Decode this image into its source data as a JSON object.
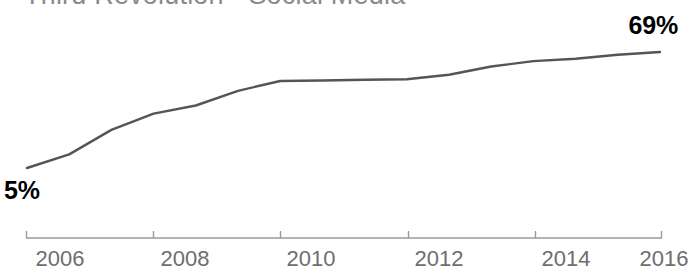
{
  "chart_data": {
    "type": "line",
    "title": "Third Revolution - Social Media",
    "xlabel": "",
    "ylabel": "",
    "x": [
      2006,
      2008,
      2010,
      2012,
      2014,
      2016
    ],
    "tick_labels": [
      "2006",
      "2008",
      "2010",
      "2012",
      "2014",
      "2016"
    ],
    "series": [
      {
        "name": "Social Media Usage",
        "values": [
          5,
          35,
          53,
          54,
          64,
          69
        ],
        "color": "#555555"
      }
    ],
    "annotations": [
      {
        "name": "start-value",
        "label": "5%",
        "value": 5,
        "x": 2006
      },
      {
        "name": "end-value",
        "label": "69%",
        "value": 69,
        "x": 2016
      }
    ],
    "xlim": [
      2006,
      2016
    ],
    "ylim": [
      0,
      75
    ],
    "grid": false,
    "legend": false,
    "axis_color": "#9a9a9a",
    "tick_label_color": "#6e6e6e",
    "title_color": "#8a8a8a",
    "value_label_color": "#000000"
  },
  "labels": {
    "start_value": "5%",
    "end_value": "69%"
  },
  "axis": {
    "ticks": [
      {
        "label": "2006"
      },
      {
        "label": "2008"
      },
      {
        "label": "2010"
      },
      {
        "label": "2012"
      },
      {
        "label": "2014"
      },
      {
        "label": "2016"
      }
    ]
  }
}
